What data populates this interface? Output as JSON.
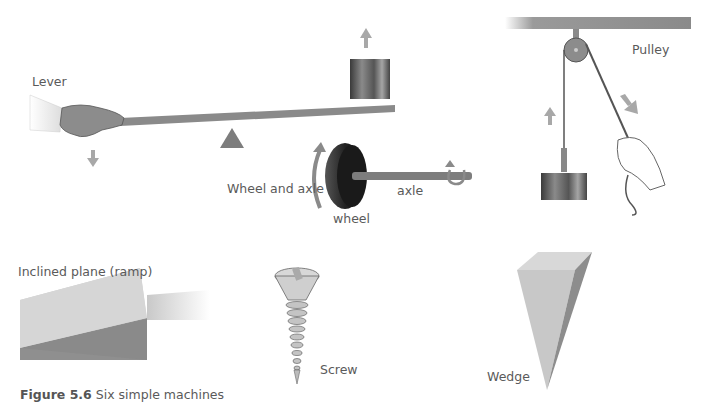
{
  "labels": {
    "lever": "Lever",
    "wheel_and_axle": "Wheel and axle",
    "wheel": "wheel",
    "axle": "axle",
    "pulley": "Pulley",
    "inclined_plane": "Inclined plane (ramp)",
    "screw": "Screw",
    "wedge": "Wedge"
  },
  "caption": {
    "number": "Figure 5.6",
    "text": " Six simple machines"
  },
  "colors": {
    "bar": "#8a8a8a",
    "arrow": "#a0a0a0",
    "fulcrum": "#7d7d7d",
    "wheel": "#2f2f2f",
    "ramp_top": "#d0d0d0",
    "ramp_side": "#8f8f8f"
  }
}
